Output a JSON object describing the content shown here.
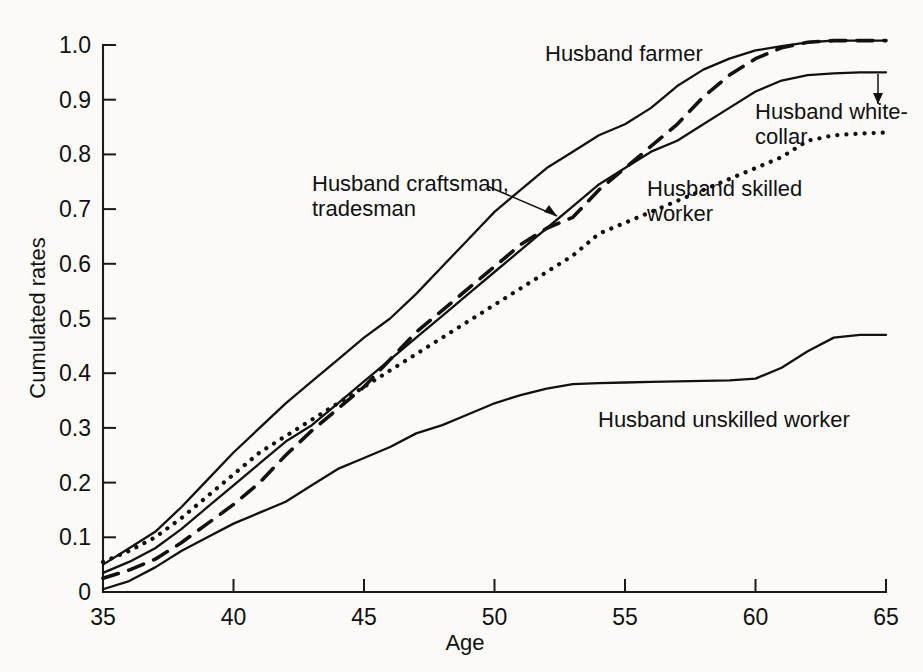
{
  "chart_data": {
    "type": "line",
    "title": "",
    "xlabel": "Age",
    "ylabel": "Cumulated rates",
    "xlim": [
      35,
      65
    ],
    "ylim": [
      0,
      1.0
    ],
    "grid": false,
    "legend_position": "inline-annotations",
    "xticks": [
      "35",
      "40",
      "45",
      "50",
      "55",
      "60",
      "65"
    ],
    "xtick_values": [
      35,
      40,
      45,
      50,
      55,
      60,
      65
    ],
    "yticks": [
      "0",
      "0.1",
      "0.2",
      "0.3",
      "0.4",
      "0.5",
      "0.6",
      "0.7",
      "0.8",
      "0.9",
      "1.0"
    ],
    "ytick_values": [
      0,
      0.1,
      0.2,
      0.3,
      0.4,
      0.5,
      0.6,
      0.7,
      0.8,
      0.9,
      1.0
    ],
    "x": [
      35,
      36,
      37,
      38,
      39,
      40,
      41,
      42,
      43,
      44,
      45,
      46,
      47,
      48,
      49,
      50,
      51,
      52,
      53,
      54,
      55,
      56,
      57,
      58,
      59,
      60,
      61,
      62,
      63,
      64,
      65
    ],
    "series": [
      {
        "name": "Husband farmer",
        "style": "solid",
        "values": [
          0.05,
          0.08,
          0.11,
          0.155,
          0.205,
          0.255,
          0.3,
          0.345,
          0.385,
          0.425,
          0.465,
          0.5,
          0.545,
          0.595,
          0.645,
          0.695,
          0.735,
          0.775,
          0.805,
          0.835,
          0.855,
          0.885,
          0.925,
          0.955,
          0.975,
          0.99,
          0.998,
          1.005,
          1.008,
          1.008,
          1.008
        ]
      },
      {
        "name": "Husband white-collar",
        "style": "solid",
        "values": [
          0.035,
          0.055,
          0.08,
          0.115,
          0.155,
          0.195,
          0.235,
          0.275,
          0.305,
          0.345,
          0.385,
          0.425,
          0.465,
          0.505,
          0.545,
          0.585,
          0.625,
          0.665,
          0.705,
          0.745,
          0.775,
          0.805,
          0.825,
          0.855,
          0.885,
          0.915,
          0.935,
          0.945,
          0.948,
          0.95,
          0.95
        ]
      },
      {
        "name": "Husband craftsman, tradesman",
        "style": "dashed",
        "values": [
          0.025,
          0.04,
          0.06,
          0.09,
          0.125,
          0.16,
          0.2,
          0.25,
          0.295,
          0.335,
          0.375,
          0.425,
          0.475,
          0.515,
          0.555,
          0.595,
          0.635,
          0.665,
          0.685,
          0.735,
          0.775,
          0.815,
          0.855,
          0.905,
          0.945,
          0.975,
          0.995,
          1.005,
          1.008,
          1.008,
          1.008
        ]
      },
      {
        "name": "Husband skilled worker",
        "style": "dotted",
        "values": [
          0.055,
          0.075,
          0.1,
          0.135,
          0.175,
          0.215,
          0.255,
          0.285,
          0.315,
          0.345,
          0.375,
          0.405,
          0.435,
          0.465,
          0.495,
          0.525,
          0.555,
          0.585,
          0.615,
          0.655,
          0.675,
          0.695,
          0.715,
          0.735,
          0.755,
          0.775,
          0.795,
          0.825,
          0.835,
          0.838,
          0.84
        ]
      },
      {
        "name": "Husband unskilled worker",
        "style": "solid",
        "values": [
          0.005,
          0.02,
          0.045,
          0.075,
          0.1,
          0.125,
          0.145,
          0.165,
          0.195,
          0.225,
          0.245,
          0.265,
          0.29,
          0.305,
          0.325,
          0.345,
          0.36,
          0.372,
          0.38,
          0.382,
          0.383,
          0.384,
          0.385,
          0.386,
          0.387,
          0.39,
          0.41,
          0.44,
          0.465,
          0.47,
          0.47
        ]
      }
    ],
    "annotations": [
      {
        "id": "farmer",
        "label_line1": "Husband farmer",
        "label_line2": "",
        "leader": false
      },
      {
        "id": "white-collar",
        "label_line1": "Husband white-",
        "label_line2": "collar",
        "leader": true
      },
      {
        "id": "craftsman",
        "label_line1": "Husband craftsman,",
        "label_line2": "tradesman",
        "leader": true
      },
      {
        "id": "skilled",
        "label_line1": "Husband skilled",
        "label_line2": "worker",
        "leader": false
      },
      {
        "id": "unskilled",
        "label_line1": "Husband unskilled worker",
        "label_line2": "",
        "leader": false
      }
    ],
    "colors": {
      "ink": "#111111",
      "background": "#fbfaf7"
    }
  }
}
